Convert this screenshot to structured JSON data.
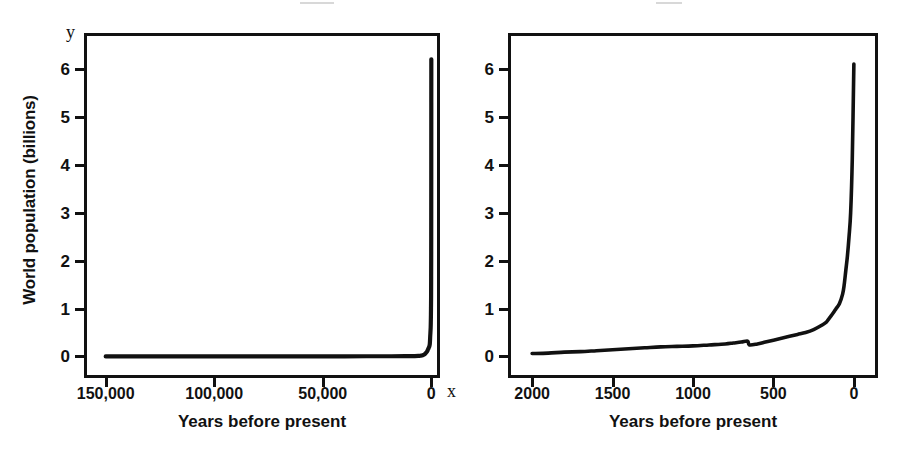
{
  "figure": {
    "ylabel_title": "World population (billions)",
    "axis_letter_y": "y",
    "axis_letter_x": "x",
    "ink_color": "#111111",
    "background_color": "#ffffff"
  },
  "panels": [
    {
      "id": "left",
      "xtitle": "Years before present",
      "xticklabels": [
        "150,000",
        "100,000",
        "50,000",
        "0"
      ],
      "xtickvalues": [
        150000,
        100000,
        50000,
        0
      ],
      "yticklabels": [
        "0",
        "1",
        "2",
        "3",
        "4",
        "5",
        "6"
      ],
      "ytickvalues": [
        0,
        1,
        2,
        3,
        4,
        5,
        6
      ]
    },
    {
      "id": "right",
      "xtitle": "Years before present",
      "xticklabels": [
        "2000",
        "1500",
        "1000",
        "500",
        "0"
      ],
      "xtickvalues": [
        2000,
        1500,
        1000,
        500,
        0
      ],
      "yticklabels": [
        "0",
        "1",
        "2",
        "3",
        "4",
        "5",
        "6"
      ],
      "ytickvalues": [
        0,
        1,
        2,
        3,
        4,
        5,
        6
      ]
    }
  ],
  "chart_data": [
    {
      "type": "line",
      "panel": "left",
      "title": "",
      "xlabel": "Years before present",
      "ylabel": "World population (billions)",
      "xlim": [
        160000,
        -4000
      ],
      "ylim": [
        -0.45,
        6.75
      ],
      "x_axis_reversed": true,
      "grid": false,
      "legend": null,
      "xticks": [
        150000,
        100000,
        50000,
        0
      ],
      "xticklabels": [
        "150,000",
        "100,000",
        "50,000",
        "0"
      ],
      "yticks": [
        0,
        1,
        2,
        3,
        4,
        5,
        6
      ],
      "yticklabels": [
        "0",
        "1",
        "2",
        "3",
        "4",
        "5",
        "6"
      ],
      "series": [
        {
          "name": "World population",
          "x": [
            150000,
            140000,
            130000,
            120000,
            110000,
            100000,
            90000,
            80000,
            70000,
            60000,
            50000,
            40000,
            30000,
            20000,
            12000,
            10000,
            8000,
            6000,
            5000,
            4000,
            3000,
            2000,
            1500,
            1000,
            700,
            500,
            300,
            200,
            150,
            100,
            60,
            40,
            20,
            10,
            0
          ],
          "y": [
            0.001,
            0.001,
            0.001,
            0.001,
            0.001,
            0.001,
            0.001,
            0.002,
            0.002,
            0.002,
            0.002,
            0.003,
            0.004,
            0.004,
            0.005,
            0.005,
            0.007,
            0.01,
            0.015,
            0.025,
            0.05,
            0.1,
            0.15,
            0.2,
            0.26,
            0.43,
            0.6,
            0.81,
            1.0,
            1.26,
            2.0,
            2.5,
            3.7,
            5.3,
            6.2
          ]
        }
      ]
    },
    {
      "type": "line",
      "panel": "right",
      "title": "",
      "xlabel": "Years before present",
      "ylabel": "World population (billions)",
      "xlim": [
        2150,
        -150
      ],
      "ylim": [
        -0.45,
        6.75
      ],
      "x_axis_reversed": true,
      "grid": false,
      "legend": null,
      "xticks": [
        2000,
        1500,
        1000,
        500,
        0
      ],
      "xticklabels": [
        "2000",
        "1500",
        "1000",
        "500",
        "0"
      ],
      "yticks": [
        0,
        1,
        2,
        3,
        4,
        5,
        6
      ],
      "yticklabels": [
        "0",
        "1",
        "2",
        "3",
        "4",
        "5",
        "6"
      ],
      "annotations": [
        "population dip near 650 years before present"
      ],
      "series": [
        {
          "name": "World population",
          "x": [
            2000,
            1900,
            1800,
            1700,
            1600,
            1500,
            1400,
            1300,
            1200,
            1100,
            1000,
            900,
            800,
            750,
            700,
            660,
            650,
            600,
            550,
            500,
            450,
            400,
            350,
            300,
            250,
            200,
            170,
            150,
            130,
            110,
            90,
            70,
            60,
            50,
            40,
            30,
            20,
            10,
            0
          ],
          "y": [
            0.06,
            0.07,
            0.09,
            0.1,
            0.12,
            0.14,
            0.16,
            0.18,
            0.2,
            0.21,
            0.22,
            0.24,
            0.26,
            0.28,
            0.3,
            0.32,
            0.24,
            0.26,
            0.3,
            0.34,
            0.38,
            0.42,
            0.46,
            0.5,
            0.56,
            0.65,
            0.72,
            0.81,
            0.9,
            1.0,
            1.1,
            1.3,
            1.5,
            1.8,
            2.1,
            2.5,
            3.0,
            4.1,
            6.1
          ]
        }
      ]
    }
  ]
}
